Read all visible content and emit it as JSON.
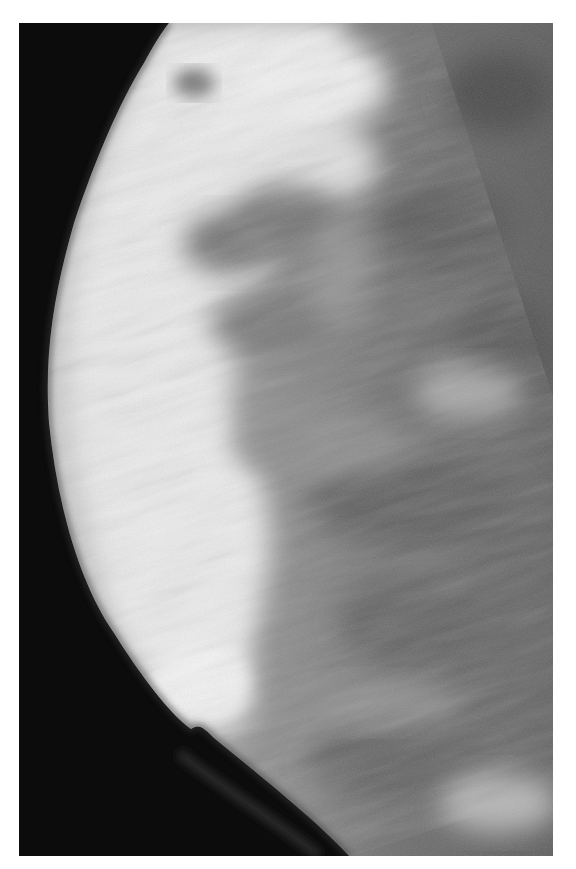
{
  "image": {
    "kind": "radiograph",
    "description": "Grayscale mammogram showing breast tissue with dense fibroglandular regions against a black background",
    "colors": {
      "background": "#0d0d0d",
      "border": "#ffffff",
      "dense_tissue": "#f2f2f2",
      "fatty_tissue": "#6a6a6a"
    }
  }
}
